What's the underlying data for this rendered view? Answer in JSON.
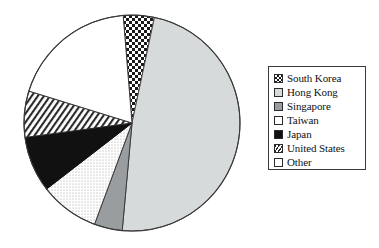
{
  "chart_data": {
    "type": "pie",
    "title": "",
    "subtitle": "",
    "xlabel": "",
    "ylabel": "",
    "legend_position": "right",
    "grid": false,
    "start_angle_deg": 12,
    "direction": "clockwise",
    "categories": [
      "South Korea",
      "Hong Kong",
      "Singapore",
      "Taiwan",
      "Japan",
      "United States",
      "Other"
    ],
    "values": [
      4.7,
      48.1,
      4.2,
      8.9,
      8.3,
      6.9,
      18.9
    ],
    "slices": [
      {
        "label": "South Korea",
        "value": 4.7,
        "start_deg": 355.3,
        "end_deg": 12.0,
        "fill": "checker",
        "color": "#ffffff",
        "edge": "#1a1a1a"
      },
      {
        "label": "Hong Kong",
        "value": 48.1,
        "start_deg": 12.0,
        "end_deg": 185.2,
        "fill": "solid",
        "color": "#d7dadb",
        "edge": "#4a4a4a"
      },
      {
        "label": "Singapore",
        "value": 4.2,
        "start_deg": 185.2,
        "end_deg": 200.3,
        "fill": "solid",
        "color": "#9a9d9f",
        "edge": "#3a3a3a"
      },
      {
        "label": "Taiwan",
        "value": 8.9,
        "start_deg": 200.3,
        "end_deg": 232.3,
        "fill": "stipple",
        "color": "#ffffff",
        "edge": "#3a3a3a"
      },
      {
        "label": "Japan",
        "value": 8.3,
        "start_deg": 232.3,
        "end_deg": 262.3,
        "fill": "solid",
        "color": "#111111",
        "edge": "#111111"
      },
      {
        "label": "United States",
        "value": 6.9,
        "start_deg": 262.3,
        "end_deg": 287.2,
        "fill": "diagonal",
        "color": "#ffffff",
        "edge": "#2a2a2a"
      },
      {
        "label": "Other",
        "value": 18.9,
        "start_deg": 287.2,
        "end_deg": 355.3,
        "fill": "solid",
        "color": "#ffffff",
        "edge": "#3a3a3a"
      }
    ],
    "geometry": {
      "cx": 132,
      "cy": 123,
      "r": 108
    }
  },
  "legend": {
    "items": [
      {
        "label": "South Korea",
        "swatch": "checker-swatch"
      },
      {
        "label": "Hong Kong",
        "swatch": "light-gray-swatch"
      },
      {
        "label": "Singapore",
        "swatch": "medium-gray-swatch"
      },
      {
        "label": "Taiwan",
        "swatch": "white-swatch"
      },
      {
        "label": "Japan",
        "swatch": "black-swatch"
      },
      {
        "label": "United States",
        "swatch": "diagonal-hatch-swatch"
      },
      {
        "label": "Other",
        "swatch": "white-swatch"
      }
    ]
  },
  "colors": {
    "light_gray": "#d7dadb",
    "medium_gray": "#9a9d9f",
    "black": "#111111",
    "white": "#ffffff",
    "outline": "#3a3a3a",
    "background": "#ffffff"
  }
}
